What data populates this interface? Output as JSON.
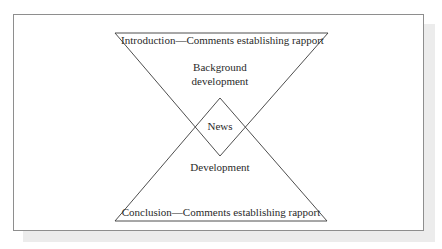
{
  "diagram": {
    "labels": {
      "introduction": "Introduction—Comments establishing rapport",
      "background_line1": "Background",
      "background_line2": "development",
      "news": "News",
      "development": "Development",
      "conclusion": "Conclusion—Comments establishing rapport"
    },
    "shapes": {
      "top_triangle": "inverted triangle (Introduction / Background development)",
      "diamond": "News",
      "bottom_triangle": "upright triangle (Development / Conclusion)"
    },
    "colors": {
      "stroke": "#3a3a3a",
      "frame_border": "#8e8e8e",
      "shadow": "#ececec"
    }
  }
}
